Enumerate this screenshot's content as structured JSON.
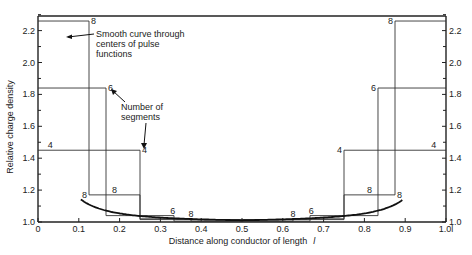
{
  "chart_data": {
    "type": "line",
    "title": "",
    "xlabel": "Distance along conductor of length",
    "xlabel_symbol": "l",
    "ylabel": "Relative charge density",
    "xlim": [
      0,
      1.0
    ],
    "ylim": [
      1.0,
      2.3
    ],
    "x_ticks": [
      "0",
      "0.1",
      "0.2",
      "0.3",
      "0.4",
      "0.5",
      "0.6",
      "0.7",
      "0.8",
      "0.9",
      "1.0"
    ],
    "x_tick_values": [
      0,
      0.1,
      0.2,
      0.3,
      0.4,
      0.5,
      0.6,
      0.7,
      0.8,
      0.9,
      1.0
    ],
    "x_end_label": "1.0l",
    "y_ticks": [
      "1.0",
      "1.2",
      "1.4",
      "1.6",
      "1.8",
      "2.0",
      "2.2"
    ],
    "y_tick_values": [
      1.0,
      1.2,
      1.4,
      1.6,
      1.8,
      2.0,
      2.2
    ],
    "grid": false,
    "series": [
      {
        "name": "4 segments (pulse functions)",
        "kind": "step",
        "label": "4",
        "segments": [
          {
            "x0": 0,
            "x1": 0.25,
            "y": 1.45
          },
          {
            "x0": 0.25,
            "x1": 0.5,
            "y": 1.015
          },
          {
            "x0": 0.5,
            "x1": 0.75,
            "y": 1.015
          },
          {
            "x0": 0.75,
            "x1": 1.0,
            "y": 1.45
          }
        ]
      },
      {
        "name": "6 segments (pulse functions)",
        "kind": "step",
        "label": "6",
        "segments": [
          {
            "x0": 0,
            "x1": 0.1667,
            "y": 1.84
          },
          {
            "x0": 0.1667,
            "x1": 0.3333,
            "y": 1.04
          },
          {
            "x0": 0.3333,
            "x1": 0.6667,
            "y": 1.005
          },
          {
            "x0": 0.6667,
            "x1": 0.8333,
            "y": 1.04
          },
          {
            "x0": 0.8333,
            "x1": 1.0,
            "y": 1.84
          }
        ]
      },
      {
        "name": "8 segments (pulse functions)",
        "kind": "step",
        "label": "8",
        "segments": [
          {
            "x0": 0,
            "x1": 0.125,
            "y": 2.26
          },
          {
            "x0": 0.125,
            "x1": 0.25,
            "y": 1.17
          },
          {
            "x0": 0.25,
            "x1": 0.375,
            "y": 1.02
          },
          {
            "x0": 0.375,
            "x1": 0.625,
            "y": 1.005
          },
          {
            "x0": 0.625,
            "x1": 0.75,
            "y": 1.02
          },
          {
            "x0": 0.75,
            "x1": 0.875,
            "y": 1.17
          },
          {
            "x0": 0.875,
            "x1": 1.0,
            "y": 2.26
          }
        ]
      },
      {
        "name": "Smooth curve through centers of pulse functions",
        "kind": "curve",
        "x": [
          0.107,
          0.125,
          0.15,
          0.1875,
          0.225,
          0.25,
          0.3,
          0.35,
          0.4,
          0.45,
          0.5,
          0.55,
          0.6,
          0.65,
          0.7,
          0.75,
          0.775,
          0.8125,
          0.85,
          0.875,
          0.893
        ],
        "y": [
          2.3,
          1.75,
          1.42,
          1.17,
          1.08,
          1.05,
          1.025,
          1.012,
          1.006,
          1.002,
          1.0,
          1.002,
          1.006,
          1.012,
          1.025,
          1.05,
          1.08,
          1.17,
          1.42,
          1.75,
          2.3
        ]
      }
    ],
    "annotations": [
      {
        "text": "Smooth curve through centers of pulse functions",
        "lines": [
          "Smooth curve through",
          "centers of pulse",
          "functions"
        ]
      },
      {
        "text": "Number of segments",
        "lines": [
          "Number of",
          "segments"
        ]
      }
    ],
    "step_labels": [
      {
        "text": "8",
        "x": 0.125,
        "y": 2.26,
        "side": "right"
      },
      {
        "text": "6",
        "x": 0.1667,
        "y": 1.84,
        "side": "right"
      },
      {
        "text": "4",
        "x": 0.03,
        "y": 1.45,
        "side": "above"
      },
      {
        "text": "4",
        "x": 0.25,
        "y": 1.45,
        "side": "right"
      },
      {
        "text": "8",
        "x": 0.125,
        "y": 1.17,
        "side": "left"
      },
      {
        "text": "8",
        "x": 0.1875,
        "y": 1.17,
        "side": "above"
      },
      {
        "text": "6",
        "x": 0.33,
        "y": 1.04,
        "side": "above"
      },
      {
        "text": "8",
        "x": 0.375,
        "y": 1.02,
        "side": "above"
      },
      {
        "text": "8",
        "x": 0.625,
        "y": 1.02,
        "side": "above"
      },
      {
        "text": "6",
        "x": 0.67,
        "y": 1.04,
        "side": "above"
      },
      {
        "text": "8",
        "x": 0.8125,
        "y": 1.17,
        "side": "above"
      },
      {
        "text": "8",
        "x": 0.875,
        "y": 1.17,
        "side": "right"
      },
      {
        "text": "4",
        "x": 0.75,
        "y": 1.45,
        "side": "left"
      },
      {
        "text": "4",
        "x": 0.97,
        "y": 1.45,
        "side": "above"
      },
      {
        "text": "6",
        "x": 0.8333,
        "y": 1.84,
        "side": "left"
      },
      {
        "text": "8",
        "x": 0.875,
        "y": 2.26,
        "side": "left"
      }
    ],
    "legend": null
  },
  "labels": {
    "ylabel": "Relative charge density",
    "xlabel": "Distance along conductor of length",
    "xlabel_symbol": "l",
    "annotation_curve": [
      "Smooth curve through",
      "centers of pulse",
      "functions"
    ],
    "annotation_segments": [
      "Number of",
      "segments"
    ]
  }
}
